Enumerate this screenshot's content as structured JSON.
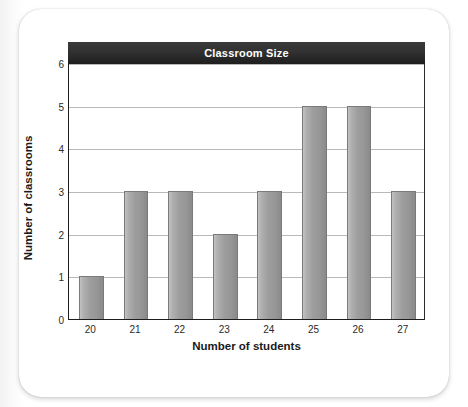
{
  "chart_data": {
    "type": "bar",
    "title": "Classroom Size",
    "xlabel": "Number of students",
    "ylabel": "Number of classrooms",
    "categories": [
      "20",
      "21",
      "22",
      "23",
      "24",
      "25",
      "26",
      "27"
    ],
    "values": [
      1,
      3,
      3,
      2,
      3,
      5,
      5,
      3
    ],
    "ylim": [
      0,
      6
    ],
    "yticks": [
      "0",
      "1",
      "2",
      "3",
      "4",
      "5",
      "6"
    ],
    "ytick_values": [
      0,
      1,
      2,
      3,
      4,
      5,
      6
    ],
    "grid": "horizontal",
    "legend": "none",
    "series": [
      {
        "name": "Number of classrooms",
        "values": [
          1,
          3,
          3,
          2,
          3,
          5,
          5,
          3
        ]
      }
    ],
    "colors": {
      "title_bar": "#2f2f2f",
      "title_text": "#ffffff",
      "bar_fill": "#9a9a9a",
      "bar_border": "#7a7a7a",
      "gridline": "#b9b9b9",
      "axis": "#1d1d1d",
      "card": "#ffffff",
      "page": "#ffffff"
    }
  }
}
